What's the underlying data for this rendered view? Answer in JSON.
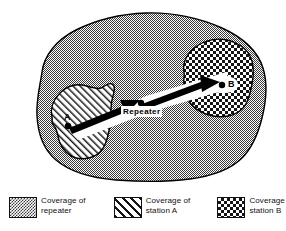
{
  "figure": {
    "type": "coverage-map-diagram",
    "title_visible": false,
    "map": {
      "regions": [
        {
          "id": "repeater-coverage",
          "name": "Coverage of repeater",
          "fill": "dither-gray",
          "color": "#9a9a9a"
        },
        {
          "id": "station-a-coverage",
          "name": "Coverage of station A",
          "fill": "diagonal-hatch",
          "color": "#ffffff"
        },
        {
          "id": "station-b-coverage",
          "name": "Coverage of station B",
          "fill": "checker-cross",
          "color": "#ffffff"
        }
      ],
      "nodes": [
        {
          "id": "station-a",
          "label": "A",
          "x": 68,
          "y": 126
        },
        {
          "id": "repeater",
          "label": "Repeater",
          "x": 141,
          "y": 103
        },
        {
          "id": "station-b",
          "label": "B",
          "x": 222,
          "y": 85
        }
      ],
      "arrows": [
        {
          "id": "a-to-repeater",
          "from": "station-a",
          "to": "repeater"
        },
        {
          "id": "repeater-to-b",
          "from": "repeater",
          "to": "station-b"
        }
      ]
    },
    "legend": {
      "items": [
        {
          "id": "legend-repeater",
          "swatch": "dither-gray",
          "line1": "Coverage of",
          "line2": "repeater"
        },
        {
          "id": "legend-station-a",
          "swatch": "diagonal-hatch",
          "line1": "Coverage of",
          "line2": "station A"
        },
        {
          "id": "legend-station-b",
          "swatch": "checker-cross",
          "line1": "Coverage of",
          "line2": "station B"
        }
      ]
    },
    "colors": {
      "ink": "#111111",
      "paper": "#ffffff",
      "gray_fill": "#9a9a9a"
    }
  }
}
